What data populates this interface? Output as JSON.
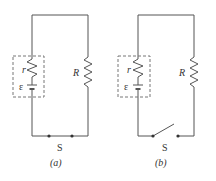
{
  "figure": {
    "circuits": [
      {
        "id": "a",
        "caption": "(a)",
        "switch_label": "S",
        "switch_state": "closed",
        "internal_resistance_label": "r",
        "emf_label": "ε",
        "load_resistor_label": "R"
      },
      {
        "id": "b",
        "caption": "(b)",
        "switch_label": "S",
        "switch_state": "open",
        "internal_resistance_label": "r",
        "emf_label": "ε",
        "load_resistor_label": "R"
      }
    ],
    "colors": {
      "wire": "#555555",
      "dashed_box": "#777777",
      "text": "#333333"
    }
  }
}
